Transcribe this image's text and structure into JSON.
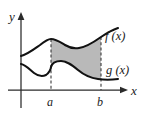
{
  "figure": {
    "background_color": "#ffffff",
    "width": 145,
    "height": 115
  },
  "axes": {
    "y_axis_label": "y",
    "x_axis_label": "x",
    "origin_px": {
      "x": 21,
      "y": 90
    },
    "x_axis_start_px": {
      "x": 8,
      "y": 90
    },
    "x_axis_end_px": {
      "x": 127,
      "y": 90
    },
    "y_axis_top_px": {
      "x": 21,
      "y": 13
    },
    "y_axis_bottom_px": {
      "x": 21,
      "y": 108
    },
    "axis_color": "#2b2b2b",
    "y_label_pos_px": {
      "x": 9,
      "y": 20
    },
    "x_label_pos_px": {
      "x": 131,
      "y": 95
    }
  },
  "curves": {
    "upper": {
      "name": "f(x)",
      "label": "f (x)",
      "label_pos_px": {
        "x": 106,
        "y": 40
      },
      "stroke_color": "#121212",
      "path": "M 21,56 C 28,54 33,50 40,45 C 45,41 48,39 51,39 C 56,39 60,42 65,45 C 70,48 74,49 79,48 C 86,47 94,42 101,37 C 107,33 112,30 118,28"
    },
    "lower": {
      "name": "g(x)",
      "label": "g (x)",
      "label_pos_px": {
        "x": 107,
        "y": 73
      },
      "stroke_color": "#121212",
      "path": "M 21,64 C 26,65 30,70 34,73 C 38,76 42,77 46,75 C 49,73 51,69 51,67 C 52,63 56,61 61,61 C 67,61 72,65 78,70 C 84,75 91,78 98,79 C 104,80 111,80 118,79"
    }
  },
  "region": {
    "name": "area-between-curves",
    "fill_color": "#b9b9b9",
    "from": "a",
    "to": "b",
    "path": "M 51,39 C 56,39 60,42 65,45 C 70,48 74,49 79,48 C 86,47 94,42 101,37 L 101,79 C 94,78 87,76 78,70 C 72,65 67,61 61,61 C 56,61 52,63 51,67 Z"
  },
  "boundaries": [
    {
      "label": "a",
      "x_px": 51,
      "label_pos_px": {
        "x": 48,
        "y": 105
      },
      "dash_top_px": 39,
      "dash_bottom_px": 90
    },
    {
      "label": "b",
      "x_px": 101,
      "label_pos_px": {
        "x": 98,
        "y": 105
      },
      "dash_top_px": 37,
      "dash_bottom_px": 90
    }
  ]
}
